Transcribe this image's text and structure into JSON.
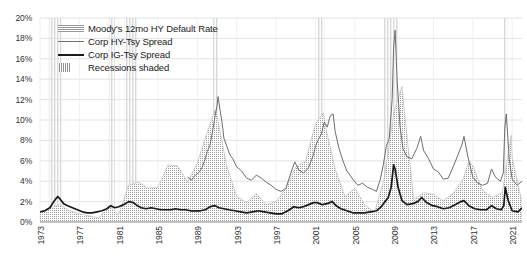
{
  "chart_data": {
    "type": "line",
    "title": "",
    "xlabel": "",
    "ylabel": "",
    "ylim": [
      0,
      20
    ],
    "xlim": [
      1973,
      2022
    ],
    "grid": true,
    "y_ticks": [
      "0%",
      "2%",
      "4%",
      "6%",
      "8%",
      "10%",
      "12%",
      "14%",
      "16%",
      "18%",
      "20%"
    ],
    "y_tick_values": [
      0,
      2,
      4,
      6,
      8,
      10,
      12,
      14,
      16,
      18,
      20
    ],
    "x_ticks": [
      "1973",
      "1977",
      "1981",
      "1985",
      "1989",
      "1993",
      "1997",
      "2001",
      "2005",
      "2009",
      "2013",
      "2017",
      "2021"
    ],
    "x_tick_values": [
      1973,
      1977,
      1981,
      1985,
      1989,
      1993,
      1997,
      2001,
      2005,
      2009,
      2013,
      2017,
      2021
    ],
    "legend_position": "top-left",
    "legend": [
      {
        "label": "Moody's 12mo HY Default Rate",
        "style": "hatched-area",
        "color": "#9a9a9a"
      },
      {
        "label": "Corp HY-Tsy Spread",
        "style": "thin-line",
        "color": "#6e6e6e"
      },
      {
        "label": "Corp IG-Tsy Spread",
        "style": "thick-line",
        "color": "#1a1a1a"
      },
      {
        "label": "Recessions shaded",
        "style": "shaded-band",
        "color": "#8e8e8e"
      }
    ],
    "recessions": [
      {
        "start": 1973.9,
        "end": 1975.2
      },
      {
        "start": 1980.0,
        "end": 1980.6
      },
      {
        "start": 1981.6,
        "end": 1982.9
      },
      {
        "start": 1990.6,
        "end": 1991.2
      },
      {
        "start": 2001.2,
        "end": 2001.9
      },
      {
        "start": 2007.9,
        "end": 2009.5
      },
      {
        "start": 2020.1,
        "end": 2020.5
      }
    ],
    "series": [
      {
        "name": "Moody's 12mo HY Default Rate",
        "style": "hatched-area",
        "color": "#9a9a9a",
        "x": [
          1973,
          1974,
          1975,
          1976,
          1977,
          1978,
          1979,
          1980,
          1981,
          1982,
          1983,
          1984,
          1985,
          1986,
          1987,
          1988,
          1989,
          1990,
          1990.8,
          1991,
          1992,
          1993,
          1994,
          1995,
          1996,
          1997,
          1998,
          1999,
          2000,
          2001,
          2001.8,
          2002,
          2003,
          2004,
          2005,
          2006,
          2007,
          2008,
          2009,
          2009.8,
          2010,
          2011,
          2012,
          2013,
          2014,
          2015,
          2016,
          2016.6,
          2017,
          2018,
          2019,
          2020,
          2020.9,
          2021,
          2022
        ],
        "values": [
          1.0,
          1.4,
          1.7,
          1.1,
          0.8,
          0.6,
          0.4,
          1.6,
          0.7,
          3.6,
          3.9,
          3.3,
          3.4,
          5.6,
          5.5,
          3.9,
          5.8,
          8.8,
          11.0,
          10.4,
          5.4,
          2.5,
          1.9,
          2.8,
          1.7,
          2.0,
          3.3,
          5.4,
          6.0,
          9.6,
          10.7,
          9.5,
          5.2,
          2.5,
          3.3,
          1.7,
          0.9,
          4.3,
          10.8,
          13.3,
          11.2,
          2.2,
          2.9,
          2.7,
          2.1,
          2.8,
          4.2,
          5.9,
          5.5,
          3.1,
          2.4,
          2.9,
          8.5,
          6.3,
          1.9
        ]
      },
      {
        "name": "Corp HY-Tsy Spread",
        "style": "thin-line",
        "color": "#6e6e6e",
        "x": [
          1988.0,
          1988.4,
          1988.8,
          1989.2,
          1989.5,
          1989.8,
          1990.0,
          1990.3,
          1990.6,
          1990.8,
          1991.0,
          1991.1,
          1991.3,
          1991.5,
          1991.7,
          1992.0,
          1992.3,
          1992.6,
          1993.0,
          1993.5,
          1994.0,
          1994.5,
          1995.0,
          1995.5,
          1996.0,
          1996.5,
          1997.0,
          1997.5,
          1998.0,
          1998.5,
          1998.9,
          1999.3,
          1999.8,
          2000.3,
          2000.8,
          2001.0,
          2001.3,
          2001.6,
          2001.9,
          2002.2,
          2002.5,
          2002.8,
          2003.0,
          2003.4,
          2003.8,
          2004.2,
          2004.8,
          2005.3,
          2005.8,
          2006.3,
          2006.8,
          2007.2,
          2007.6,
          2007.9,
          2008.2,
          2008.5,
          2008.8,
          2008.95,
          2009.1,
          2009.3,
          2009.6,
          2009.9,
          2010.3,
          2010.8,
          2011.3,
          2011.7,
          2012.0,
          2012.5,
          2013.0,
          2013.5,
          2014.0,
          2014.5,
          2015.0,
          2015.5,
          2015.9,
          2016.1,
          2016.5,
          2017.0,
          2017.5,
          2018.0,
          2018.5,
          2018.9,
          2019.3,
          2019.8,
          2020.1,
          2020.25,
          2020.4,
          2020.7,
          2021.0,
          2021.5,
          2022.0
        ],
        "values": [
          4.4,
          4.1,
          4.6,
          4.9,
          5.4,
          6.2,
          6.9,
          7.6,
          9.2,
          10.4,
          11.4,
          12.3,
          11.0,
          9.8,
          8.2,
          7.4,
          6.6,
          6.2,
          5.4,
          5.0,
          4.3,
          4.1,
          4.6,
          4.3,
          3.9,
          3.6,
          3.2,
          3.0,
          3.3,
          4.8,
          5.9,
          5.1,
          4.8,
          5.3,
          6.6,
          7.4,
          8.1,
          8.6,
          9.8,
          9.3,
          10.4,
          10.6,
          8.9,
          7.2,
          6.0,
          5.0,
          4.2,
          3.6,
          3.8,
          3.4,
          3.2,
          3.0,
          4.2,
          5.6,
          7.4,
          8.2,
          12.0,
          17.2,
          18.8,
          14.0,
          9.4,
          7.2,
          6.4,
          6.2,
          7.2,
          8.4,
          7.0,
          6.2,
          5.2,
          4.9,
          4.2,
          4.3,
          5.4,
          6.6,
          7.6,
          8.4,
          6.4,
          4.4,
          3.8,
          3.6,
          3.8,
          5.2,
          4.4,
          4.0,
          4.8,
          9.2,
          10.6,
          6.2,
          4.2,
          3.6,
          4.0
        ]
      },
      {
        "name": "Corp IG-Tsy Spread",
        "style": "thick-line",
        "color": "#1a1a1a",
        "x": [
          1973.0,
          1973.5,
          1974.0,
          1974.4,
          1974.8,
          1975.0,
          1975.4,
          1975.8,
          1976.3,
          1976.8,
          1977.3,
          1977.8,
          1978.3,
          1978.8,
          1979.3,
          1979.8,
          1980.2,
          1980.6,
          1981.0,
          1981.5,
          1982.0,
          1982.5,
          1982.9,
          1983.3,
          1983.8,
          1984.3,
          1984.8,
          1985.3,
          1985.8,
          1986.3,
          1986.8,
          1987.3,
          1987.8,
          1988.3,
          1988.8,
          1989.3,
          1989.8,
          1990.3,
          1990.8,
          1991.2,
          1991.7,
          1992.2,
          1992.8,
          1993.4,
          1994.0,
          1994.6,
          1995.2,
          1995.8,
          1996.4,
          1997.0,
          1997.6,
          1998.2,
          1998.8,
          1999.3,
          1999.8,
          2000.3,
          2000.8,
          2001.2,
          2001.7,
          2002.2,
          2002.7,
          2003.1,
          2003.6,
          2004.2,
          2004.8,
          2005.4,
          2006.0,
          2006.6,
          2007.2,
          2007.7,
          2008.0,
          2008.4,
          2008.7,
          2008.95,
          2009.1,
          2009.4,
          2009.8,
          2010.3,
          2010.9,
          2011.4,
          2011.8,
          2012.3,
          2012.9,
          2013.4,
          2014.0,
          2014.6,
          2015.2,
          2015.8,
          2016.1,
          2016.6,
          2017.2,
          2017.8,
          2018.4,
          2018.9,
          2019.4,
          2019.9,
          2020.15,
          2020.3,
          2020.6,
          2021.0,
          2021.6,
          2022.0
        ],
        "values": [
          1.0,
          1.1,
          1.4,
          2.0,
          2.5,
          2.3,
          1.8,
          1.6,
          1.4,
          1.2,
          1.0,
          0.9,
          0.9,
          1.0,
          1.1,
          1.3,
          1.6,
          1.4,
          1.5,
          1.7,
          2.0,
          1.9,
          1.6,
          1.4,
          1.3,
          1.4,
          1.3,
          1.2,
          1.2,
          1.2,
          1.3,
          1.2,
          1.2,
          1.1,
          1.1,
          1.1,
          1.2,
          1.5,
          1.6,
          1.4,
          1.3,
          1.2,
          1.1,
          1.0,
          0.9,
          1.0,
          1.1,
          1.0,
          0.9,
          0.8,
          0.8,
          1.1,
          1.5,
          1.4,
          1.5,
          1.7,
          1.9,
          1.9,
          1.7,
          1.8,
          2.0,
          1.6,
          1.3,
          1.1,
          0.9,
          0.9,
          0.9,
          1.0,
          1.1,
          1.5,
          1.9,
          2.4,
          3.4,
          5.6,
          5.2,
          3.4,
          2.1,
          1.7,
          1.8,
          2.0,
          2.4,
          1.9,
          1.6,
          1.5,
          1.3,
          1.4,
          1.7,
          2.0,
          2.1,
          1.6,
          1.3,
          1.2,
          1.2,
          1.6,
          1.3,
          1.2,
          1.6,
          3.4,
          2.1,
          1.1,
          1.0,
          1.4
        ]
      }
    ]
  },
  "axes": {
    "y_title": "",
    "x_title": ""
  }
}
